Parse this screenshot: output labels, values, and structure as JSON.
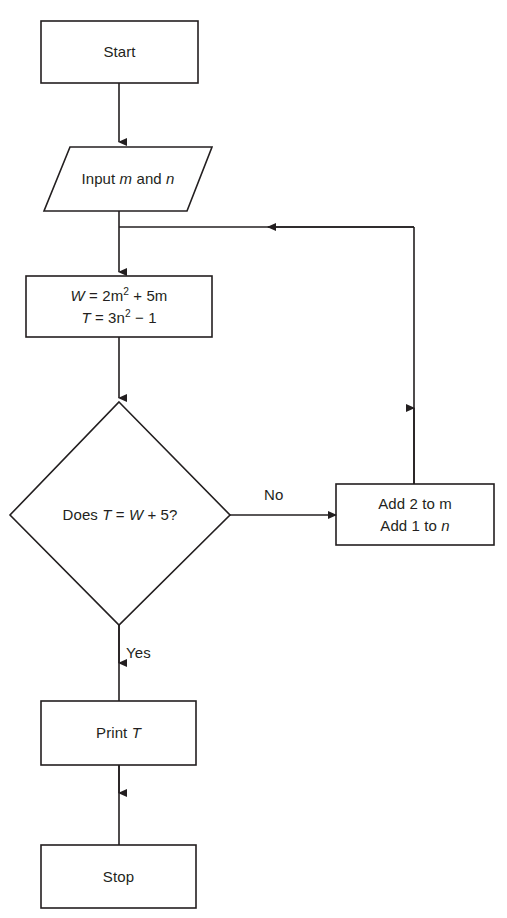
{
  "diagram": {
    "type": "flowchart",
    "line_color": "#231f20",
    "fill_color": "#ffffff",
    "text_color": "#231f20",
    "width": 507,
    "height": 918
  },
  "nodes": {
    "start": {
      "shape": "rectangle",
      "label": "Start"
    },
    "input": {
      "shape": "parallelogram",
      "label_prefix": "Input ",
      "label_var1": "m",
      "label_middle": " and ",
      "label_var2": "n",
      "label_plain": "Input m and n"
    },
    "process": {
      "shape": "rectangle",
      "line1_var": "W",
      "line1_eq": " = 2m",
      "line1_sup": "2",
      "line1_tail": " + 5m",
      "line1_plain": "W = 2m² + 5m",
      "line2_var": "T",
      "line2_eq": " = 3n",
      "line2_sup": "2",
      "line2_tail": " − 1",
      "line2_plain": "T = 3n² − 1"
    },
    "decision": {
      "shape": "diamond",
      "prefix": "Does ",
      "var1": "T",
      "mid": " = ",
      "var2": "W",
      "tail": " + 5?",
      "label_plain": "Does T = W + 5?"
    },
    "update": {
      "shape": "rectangle",
      "line1": "Add 2 to m",
      "line2_prefix": "Add 1 to ",
      "line2_var": "n",
      "line2_plain": "Add 1 to n"
    },
    "print": {
      "shape": "rectangle",
      "prefix": "Print ",
      "var": "T",
      "label_plain": "Print T"
    },
    "stop": {
      "shape": "rectangle",
      "label": "Stop"
    }
  },
  "edges": {
    "no_label": "No",
    "yes_label": "Yes"
  }
}
